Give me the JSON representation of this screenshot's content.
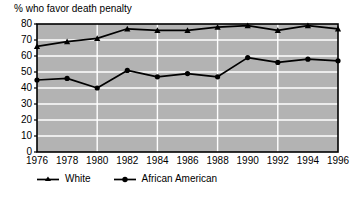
{
  "chart_data": {
    "type": "line",
    "title": "% who favor death penalty",
    "xlabel": "",
    "ylabel": "",
    "ylim": [
      0,
      80
    ],
    "ytick_step": 10,
    "grid": true,
    "legend_position": "bottom",
    "plot_background": "#b3b3b3",
    "grid_color": "#ffffff",
    "line_color": "#000000",
    "categories": [
      1976,
      1978,
      1980,
      1982,
      1984,
      1986,
      1988,
      1990,
      1992,
      1994,
      1996
    ],
    "ytick_labels": [
      "80",
      "70",
      "60",
      "50",
      "40",
      "30",
      "20",
      "10",
      "0"
    ],
    "ytick_values": [
      80,
      70,
      60,
      50,
      40,
      30,
      20,
      10,
      0
    ],
    "xtick_labels": [
      "1976",
      "1978",
      "1980",
      "1982",
      "1984",
      "1986",
      "1988",
      "1990",
      "1992",
      "1994",
      "1996"
    ],
    "series": [
      {
        "name": "White",
        "marker": "triangle",
        "values": [
          66,
          69,
          71,
          77,
          76,
          76,
          78,
          79,
          76,
          79,
          77
        ]
      },
      {
        "name": "African American",
        "marker": "circle",
        "values": [
          45,
          46,
          40,
          51,
          47,
          49,
          47,
          59,
          56,
          58,
          57
        ]
      }
    ],
    "legend": [
      {
        "label": "White",
        "marker": "triangle"
      },
      {
        "label": "African American",
        "marker": "circle"
      }
    ]
  }
}
